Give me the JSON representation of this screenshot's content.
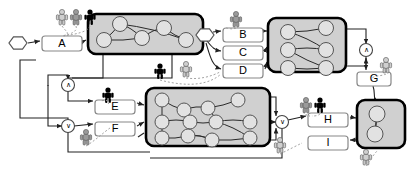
{
  "diagram": {
    "colors": {
      "container_fill": "#d0d0d0",
      "container_stroke": "#000000",
      "node_fill": "#e2e2e2",
      "node_stroke": "#555555",
      "task_fill": "#ffffff",
      "task_stroke": "#888888",
      "edge": "#222222",
      "dashed_edge": "#999999",
      "actor_black": "#000000",
      "actor_gray": "#9a9a9a",
      "actor_light": "#cfcfcf"
    },
    "tasks": [
      {
        "id": "A",
        "label": "A",
        "x": 42,
        "y": 36,
        "w": 40,
        "h": 15
      },
      {
        "id": "B",
        "label": "B",
        "x": 223,
        "y": 28,
        "w": 40,
        "h": 14
      },
      {
        "id": "C",
        "label": "C",
        "x": 223,
        "y": 46,
        "w": 40,
        "h": 14
      },
      {
        "id": "D",
        "label": "D",
        "x": 223,
        "y": 64,
        "w": 40,
        "h": 14
      },
      {
        "id": "E",
        "label": "E",
        "x": 95,
        "y": 100,
        "w": 40,
        "h": 14
      },
      {
        "id": "F",
        "label": "F",
        "x": 95,
        "y": 122,
        "w": 40,
        "h": 14
      },
      {
        "id": "G",
        "label": "G",
        "x": 357,
        "y": 72,
        "w": 34,
        "h": 14
      },
      {
        "id": "H",
        "label": "H",
        "x": 308,
        "y": 113,
        "w": 40,
        "h": 14
      },
      {
        "id": "I",
        "label": "I",
        "x": 308,
        "y": 136,
        "w": 40,
        "h": 14
      }
    ],
    "operators": [
      {
        "id": "op-and-top",
        "label": "∧",
        "cx": 366,
        "cy": 50
      },
      {
        "id": "op-and-left",
        "label": "∧",
        "cx": 68,
        "cy": 85
      },
      {
        "id": "op-or-left",
        "label": "∨",
        "cx": 68,
        "cy": 126
      },
      {
        "id": "op-or-mid",
        "label": "∨",
        "cx": 282,
        "cy": 122
      }
    ],
    "start_events": [
      {
        "id": "start-a",
        "cx": 18,
        "cy": 43
      },
      {
        "id": "start-b",
        "cx": 205,
        "cy": 35
      }
    ],
    "containers": [
      {
        "id": "container-1",
        "x": 88,
        "y": 14,
        "w": 115,
        "h": 40
      },
      {
        "id": "container-2",
        "x": 268,
        "y": 18,
        "w": 78,
        "h": 54
      },
      {
        "id": "container-3",
        "x": 146,
        "y": 88,
        "w": 124,
        "h": 58
      },
      {
        "id": "container-4",
        "x": 357,
        "y": 100,
        "w": 48,
        "h": 48
      }
    ],
    "actors": [
      {
        "id": "actor-a-1",
        "x": 62,
        "y": 12,
        "shade": "light"
      },
      {
        "id": "actor-a-2",
        "x": 76,
        "y": 12,
        "shade": "gray"
      },
      {
        "id": "actor-a-3",
        "x": 90,
        "y": 12,
        "shade": "black"
      },
      {
        "id": "actor-b-1",
        "x": 236,
        "y": 14,
        "shade": "gray"
      },
      {
        "id": "actor-mid-1",
        "x": 160,
        "y": 66,
        "shade": "black"
      },
      {
        "id": "actor-mid-2",
        "x": 186,
        "y": 64,
        "shade": "light"
      },
      {
        "id": "actor-g-1",
        "x": 386,
        "y": 60,
        "shade": "light"
      },
      {
        "id": "actor-e-1",
        "x": 108,
        "y": 90,
        "shade": "black"
      },
      {
        "id": "actor-f-1",
        "x": 86,
        "y": 132,
        "shade": "gray"
      },
      {
        "id": "actor-h-1",
        "x": 306,
        "y": 100,
        "shade": "gray"
      },
      {
        "id": "actor-h-2",
        "x": 320,
        "y": 100,
        "shade": "black"
      },
      {
        "id": "actor-i-1",
        "x": 280,
        "y": 140,
        "shade": "light"
      },
      {
        "id": "actor-r-1",
        "x": 366,
        "y": 152,
        "shade": "light"
      }
    ],
    "node_counts": {
      "container_1": 5,
      "container_2": 6,
      "container_3": 11,
      "container_4": 2
    }
  }
}
